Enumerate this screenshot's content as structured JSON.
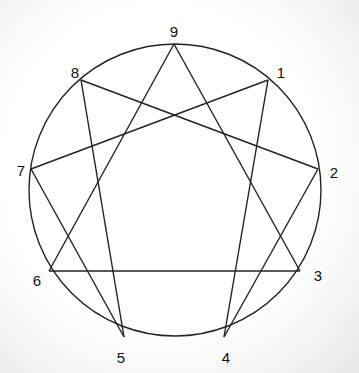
{
  "diagram": {
    "type": "enneagram",
    "circle": {
      "cx": 175,
      "cy": 190,
      "r": 146
    },
    "points": [
      {
        "label": "9",
        "x": 174,
        "y": 44,
        "lx": 174,
        "ly": 33
      },
      {
        "label": "1",
        "x": 268,
        "y": 80,
        "lx": 281,
        "ly": 74
      },
      {
        "label": "2",
        "x": 318,
        "y": 169,
        "lx": 334,
        "ly": 174
      },
      {
        "label": "3",
        "x": 300,
        "y": 271,
        "lx": 318,
        "ly": 277
      },
      {
        "label": "4",
        "x": 224,
        "y": 337,
        "lx": 226,
        "ly": 359
      },
      {
        "label": "5",
        "x": 124,
        "y": 337,
        "lx": 121,
        "ly": 359
      },
      {
        "label": "6",
        "x": 49,
        "y": 271,
        "lx": 37,
        "ly": 282
      },
      {
        "label": "7",
        "x": 31,
        "y": 169,
        "lx": 21,
        "ly": 172
      },
      {
        "label": "8",
        "x": 81,
        "y": 80,
        "lx": 75,
        "ly": 74
      }
    ],
    "lines": [
      [
        "9",
        "3"
      ],
      [
        "3",
        "6"
      ],
      [
        "6",
        "9"
      ],
      [
        "1",
        "4"
      ],
      [
        "4",
        "2"
      ],
      [
        "2",
        "8"
      ],
      [
        "8",
        "5"
      ],
      [
        "5",
        "7"
      ],
      [
        "7",
        "1"
      ]
    ],
    "stroke_color": "#222222"
  }
}
